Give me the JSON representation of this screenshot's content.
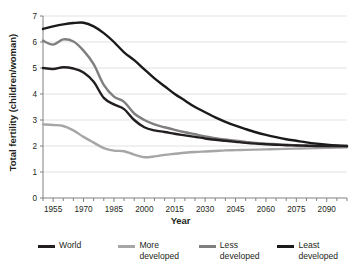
{
  "chart_data": {
    "type": "line",
    "title": "",
    "xlabel": "Year",
    "ylabel": "Total fertility (children/woman)",
    "xlim": [
      1950,
      2100
    ],
    "ylim": [
      0,
      7
    ],
    "yticks": [
      0,
      1,
      2,
      3,
      4,
      5,
      6,
      7
    ],
    "ytick_labels": [
      "0",
      "1",
      "2",
      "3",
      "4",
      "5",
      "6",
      "7"
    ],
    "xticks": [
      1955,
      1970,
      1985,
      2000,
      2015,
      2030,
      2045,
      2060,
      2075,
      2090
    ],
    "xtick_labels": [
      "1955",
      "1970",
      "1985",
      "2000",
      "2015",
      "2030",
      "2045",
      "2060",
      "2075",
      "2090"
    ],
    "x_minor_tick_interval": 5,
    "grid": "horizontal",
    "grid_color": "#d9d9d9",
    "legend_position": "bottom",
    "x": [
      1950,
      1955,
      1960,
      1965,
      1970,
      1975,
      1980,
      1985,
      1990,
      1995,
      2000,
      2005,
      2010,
      2015,
      2020,
      2025,
      2030,
      2035,
      2040,
      2045,
      2050,
      2055,
      2060,
      2065,
      2070,
      2075,
      2080,
      2085,
      2090,
      2095,
      2100
    ],
    "series": [
      {
        "name": "World",
        "color": "#231f20",
        "width": 2.4,
        "values": [
          5.0,
          4.96,
          5.03,
          4.98,
          4.83,
          4.47,
          3.85,
          3.6,
          3.42,
          3.0,
          2.72,
          2.6,
          2.54,
          2.47,
          2.41,
          2.35,
          2.29,
          2.24,
          2.2,
          2.16,
          2.12,
          2.09,
          2.07,
          2.05,
          2.03,
          2.02,
          2.01,
          2.0,
          2.0,
          2.0,
          2.0
        ]
      },
      {
        "name": "More developed",
        "color": "#a6a6a6",
        "width": 2.4,
        "values": [
          2.83,
          2.81,
          2.77,
          2.6,
          2.35,
          2.13,
          1.92,
          1.82,
          1.8,
          1.67,
          1.57,
          1.6,
          1.66,
          1.7,
          1.74,
          1.77,
          1.79,
          1.81,
          1.83,
          1.84,
          1.85,
          1.86,
          1.87,
          1.88,
          1.89,
          1.9,
          1.91,
          1.92,
          1.93,
          1.94,
          1.95
        ]
      },
      {
        "name": "Less developed",
        "color": "#7f7f7f",
        "width": 2.4,
        "values": [
          6.05,
          5.9,
          6.1,
          6.02,
          5.67,
          5.15,
          4.35,
          3.9,
          3.7,
          3.25,
          3.0,
          2.83,
          2.72,
          2.62,
          2.53,
          2.45,
          2.37,
          2.3,
          2.25,
          2.2,
          2.16,
          2.12,
          2.09,
          2.07,
          2.05,
          2.03,
          2.02,
          2.01,
          2.0,
          1.99,
          1.98
        ]
      },
      {
        "name": "Least developed",
        "color": "#1a1a1a",
        "width": 2.4,
        "values": [
          6.5,
          6.6,
          6.68,
          6.73,
          6.74,
          6.6,
          6.34,
          6.0,
          5.6,
          5.3,
          4.95,
          4.6,
          4.3,
          4.0,
          3.75,
          3.5,
          3.3,
          3.1,
          2.93,
          2.78,
          2.65,
          2.53,
          2.43,
          2.34,
          2.26,
          2.2,
          2.14,
          2.09,
          2.05,
          2.02,
          2.0
        ]
      }
    ]
  },
  "legend": {
    "items": [
      {
        "label": "World",
        "color": "#231f20"
      },
      {
        "label": "More\ndeveloped",
        "color": "#a6a6a6"
      },
      {
        "label": "Less\ndeveloped",
        "color": "#7f7f7f"
      },
      {
        "label": "Least\ndeveloped",
        "color": "#1a1a1a"
      }
    ]
  }
}
